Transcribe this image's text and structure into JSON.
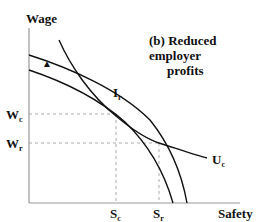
{
  "diagram": {
    "title_prefix": "(b)",
    "title_line1": "Reduced employer",
    "title_line2": "profits",
    "y_axis_label": "Wage",
    "x_axis_label": "Safety",
    "y_ticks": [
      {
        "main": "W",
        "sub": "c"
      },
      {
        "main": "W",
        "sub": "r"
      }
    ],
    "x_ticks": [
      {
        "main": "S",
        "sub": "c"
      },
      {
        "main": "S",
        "sub": "r"
      }
    ],
    "curve_labels": [
      {
        "main": "I",
        "sub": "r"
      },
      {
        "main": "U",
        "sub": "c"
      }
    ],
    "marker": "▲"
  }
}
